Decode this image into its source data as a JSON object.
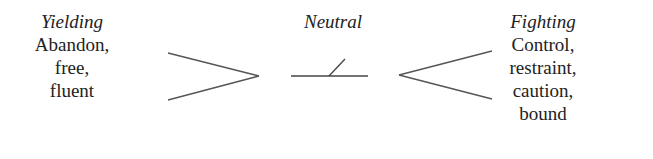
{
  "diagram": {
    "columns": [
      {
        "title": "Yielding",
        "lines": [
          "Abandon,",
          "free,",
          "fluent"
        ]
      },
      {
        "title": "Neutral",
        "lines": []
      },
      {
        "title": "Fighting",
        "lines": [
          "Control,",
          "restraint,",
          "caution,",
          "bound"
        ]
      }
    ],
    "symbols": [
      {
        "name": "yielding-symbol",
        "shape": "open-angle-right"
      },
      {
        "name": "neutral-symbol",
        "shape": "horizontal-line-with-tick"
      },
      {
        "name": "fighting-symbol",
        "shape": "open-angle-left"
      }
    ],
    "colors": {
      "text": "#222222",
      "stroke": "#555555",
      "background": "#ffffff"
    }
  }
}
